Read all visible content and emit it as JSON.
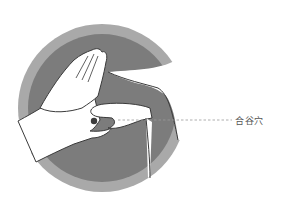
{
  "illustration": {
    "subject": "Hand acupressure on Hegu point",
    "callout_label": "合谷穴",
    "colors": {
      "background": "#ffffff",
      "outer_ring": "#a9a9a9",
      "inner_disc": "#7c7c7c",
      "hand_fill": "#ffffff",
      "outline": "#3a3a3a",
      "acupoint_dot": "#3c3c3c",
      "leader_line": "#9a9a9a",
      "label_text": "#555555"
    }
  }
}
